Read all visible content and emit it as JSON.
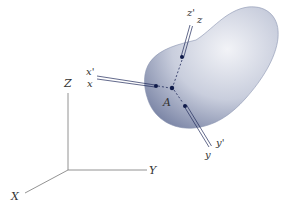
{
  "diagram": {
    "type": "rigid-body-coordinate-axes",
    "global_axes": {
      "x_label": "X",
      "y_label": "Y",
      "z_label": "Z"
    },
    "point": {
      "label": "A"
    },
    "local_axes": {
      "x_label": "x",
      "x_prime_label": "x'",
      "y_label": "y",
      "y_prime_label": "y'",
      "z_label": "z",
      "z_prime_label": "z'"
    },
    "colors": {
      "body_fill_light": "#e4e7ef",
      "body_fill_dark": "#7e88a8",
      "axis_line": "#1f2a5a",
      "dot": "#0f1a4a",
      "global_axis": "#666666",
      "label": "#333333"
    }
  }
}
